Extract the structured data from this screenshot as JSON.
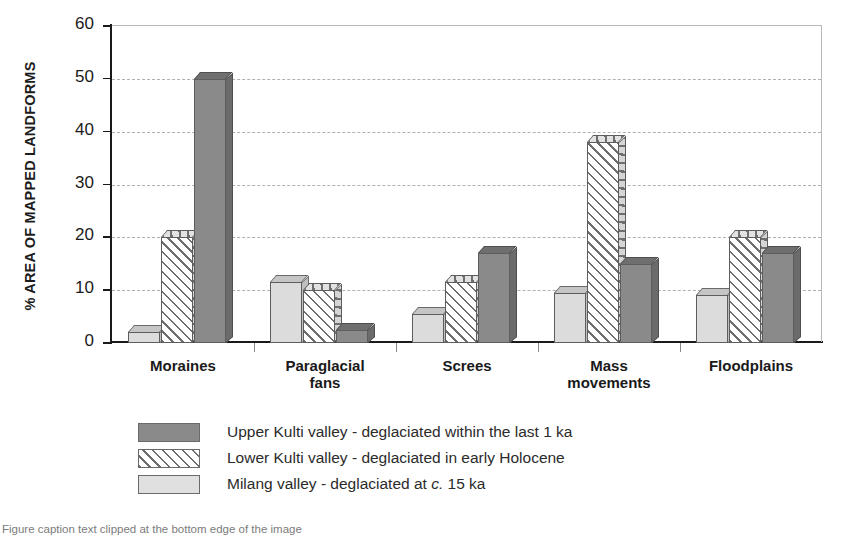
{
  "chart_data": {
    "type": "bar",
    "title": "",
    "xlabel": "",
    "ylabel": "% AREA OF MAPPED LANDFORMS",
    "ylim": [
      0,
      60
    ],
    "yticks": [
      0,
      10,
      20,
      30,
      40,
      50,
      60
    ],
    "grid": true,
    "legend_position": "below",
    "categories": [
      "Moraines",
      "Paraglacial fans",
      "Screes",
      "Mass movements",
      "Floodplains"
    ],
    "category_lines": [
      [
        "Moraines"
      ],
      [
        "Paraglacial",
        "fans"
      ],
      [
        "Screes"
      ],
      [
        "Mass",
        "movements"
      ],
      [
        "Floodplains"
      ]
    ],
    "series": [
      {
        "name": "Milang valley - deglaciated at c. 15 ka",
        "key": "milang",
        "pattern": "light-solid",
        "color": "#dcdcdc",
        "values": [
          2,
          11.5,
          5.5,
          9.5,
          9
        ]
      },
      {
        "name": "Lower Kulti valley - deglaciated in early Holocene",
        "key": "lower-kulti",
        "pattern": "diagonal-hatch",
        "color": "#6e6e6e",
        "values": [
          20,
          10,
          11.5,
          38,
          20
        ]
      },
      {
        "name": "Upper Kulti valley - deglaciated within the last 1 ka",
        "key": "upper-kulti",
        "pattern": "dark-solid",
        "color": "#8a8a8a",
        "values": [
          50,
          2.5,
          17,
          15,
          17
        ]
      }
    ]
  },
  "legend": {
    "items": [
      {
        "swatch": "dark-solid",
        "text_before_italic": "Upper Kulti valley - deglaciated within the last 1 ka",
        "italic": "",
        "text_after_italic": ""
      },
      {
        "swatch": "diagonal-hatch",
        "text_before_italic": "Lower Kulti valley - deglaciated in early Holocene",
        "italic": "",
        "text_after_italic": ""
      },
      {
        "swatch": "light-solid",
        "text_before_italic": "Milang valley - deglaciated at ",
        "italic": "c.",
        "text_after_italic": " 15 ka"
      }
    ]
  },
  "caption": {
    "text": "Figure caption text clipped at the bottom edge of the image"
  },
  "colors": {
    "axis": "#1a1a1a",
    "grid": "#b0b0b0",
    "dark_series": "#8a8a8a",
    "hatch_series": "#6e6e6e",
    "light_series": "#dcdcdc"
  }
}
